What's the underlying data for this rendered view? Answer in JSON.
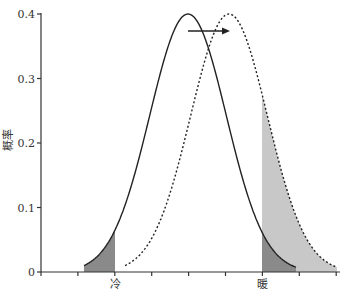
{
  "chart_data": {
    "type": "line",
    "title": "",
    "xlabel": "",
    "ylabel": "概率",
    "ylim": [
      0,
      0.4
    ],
    "yticks": [
      0,
      0.1,
      0.2,
      0.3,
      0.4
    ],
    "ytick_labels": [
      "0",
      "0.1",
      "0.2",
      "0.3",
      "0.4"
    ],
    "x_category_labels": [
      {
        "label": "冷",
        "x_px": 115
      },
      {
        "label": "暖",
        "x_px": 262
      }
    ],
    "series": [
      {
        "name": "original-distribution",
        "style": "solid",
        "mean_px": 188,
        "sigma_px": 38.3,
        "peak": 0.4,
        "x_start_px": 84,
        "x_end_px": 296
      },
      {
        "name": "shifted-distribution",
        "style": "dashed",
        "mean_px": 229,
        "sigma_px": 38.3,
        "peak": 0.4,
        "x_start_px": 125,
        "x_end_px": 337
      }
    ],
    "shaded_regions": [
      {
        "name": "cold-tail-original",
        "series": "original-distribution",
        "from_px": 84,
        "to_px": 115,
        "color": "#8a8a8a"
      },
      {
        "name": "hot-tail-shifted",
        "series": "shifted-distribution",
        "from_px": 262,
        "to_px": 337,
        "color": "#c8c8c8"
      },
      {
        "name": "hot-tail-original",
        "series": "original-distribution",
        "from_px": 262,
        "to_px": 296,
        "color": "#8a8a8a"
      }
    ],
    "annotations": [
      {
        "type": "arrow",
        "from_px": [
          188,
          31
        ],
        "to_px": [
          230,
          31
        ],
        "meaning": "distribution shift to the right"
      }
    ],
    "grid": false,
    "legend": null
  },
  "colors": {
    "axis": "#333333",
    "curve": "#222222",
    "dark_shade": "#8a8a8a",
    "light_shade": "#c8c8c8"
  }
}
